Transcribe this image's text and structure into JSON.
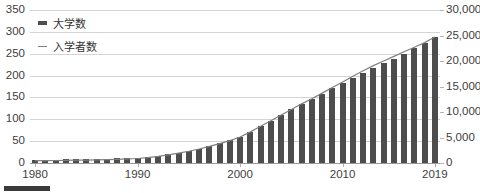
{
  "chart_data": {
    "type": "bar",
    "title": "",
    "xlabel": "",
    "ylabel": "",
    "grid": true,
    "legend_position": "top-left",
    "x": [
      1980,
      1981,
      1982,
      1983,
      1984,
      1985,
      1986,
      1987,
      1988,
      1989,
      1990,
      1991,
      1992,
      1993,
      1994,
      1995,
      1996,
      1997,
      1998,
      1999,
      2000,
      2001,
      2002,
      2003,
      2004,
      2005,
      2006,
      2007,
      2008,
      2009,
      2010,
      2011,
      2012,
      2013,
      2014,
      2015,
      2016,
      2017,
      2018,
      2019
    ],
    "xtick_labels": [
      "1980",
      "1990",
      "2000",
      "2010",
      "2019"
    ],
    "xtick_values": [
      1980,
      1990,
      2000,
      2010,
      2019
    ],
    "left_axis": {
      "label": "",
      "ylim": [
        0,
        350
      ],
      "ticks": [
        0,
        50,
        100,
        150,
        200,
        250,
        300,
        350
      ],
      "tick_labels": [
        "0",
        "50",
        "100",
        "150",
        "200",
        "250",
        "300",
        "350"
      ]
    },
    "right_axis": {
      "label": "",
      "ylim": [
        0,
        30000
      ],
      "ticks": [
        0,
        5000,
        10000,
        15000,
        20000,
        25000,
        30000
      ],
      "tick_labels": [
        "0",
        "5,000",
        "10,000",
        "15,000",
        "20,000",
        "25,000",
        "30,000"
      ]
    },
    "series": [
      {
        "name": "大学数",
        "type": "bar",
        "axis": "left",
        "color": "#4d4d4d",
        "values": [
          8,
          8,
          8,
          9,
          9,
          9,
          10,
          10,
          11,
          11,
          12,
          14,
          17,
          20,
          24,
          28,
          33,
          39,
          46,
          52,
          60,
          72,
          85,
          97,
          110,
          123,
          135,
          146,
          158,
          171,
          183,
          195,
          207,
          218,
          228,
          238,
          250,
          262,
          274,
          288
        ]
      },
      {
        "name": "入学者数",
        "type": "line",
        "axis": "right",
        "color": "#808080",
        "values": [
          450,
          470,
          490,
          520,
          550,
          580,
          620,
          660,
          720,
          790,
          880,
          1050,
          1300,
          1600,
          1950,
          2300,
          2750,
          3250,
          3800,
          4400,
          5100,
          6100,
          7200,
          8300,
          9400,
          10500,
          11600,
          12600,
          13700,
          14800,
          15900,
          17000,
          18100,
          19100,
          20000,
          20900,
          21800,
          22700,
          23600,
          24700
        ]
      }
    ]
  },
  "legend": {
    "items": [
      {
        "label": "大学数",
        "marker": "bar-swatch"
      },
      {
        "label": "入学者数",
        "marker": "line-swatch"
      }
    ]
  },
  "caption": {
    "chip_label": "",
    "text": ""
  }
}
